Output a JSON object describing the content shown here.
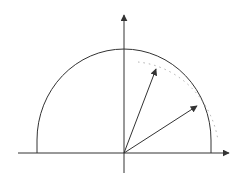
{
  "diagram": {
    "type": "semicircle-with-vectors",
    "colors": {
      "background": "#ffffff",
      "stroke": "#333333",
      "dotted": "#999999"
    },
    "origin": [
      124,
      153
    ],
    "x_axis": {
      "from": [
        18,
        153
      ],
      "to": [
        229,
        153
      ]
    },
    "y_axis": {
      "from": [
        124,
        173
      ],
      "to": [
        124,
        15
      ]
    },
    "semicircle": {
      "cx": 124,
      "cy": 153,
      "rx": 87,
      "ry": 91
    },
    "vectors": [
      {
        "name": "upper-vector",
        "tip": [
          156,
          69
        ]
      },
      {
        "name": "lower-vector",
        "tip": [
          197,
          106
        ]
      }
    ],
    "labels": []
  }
}
